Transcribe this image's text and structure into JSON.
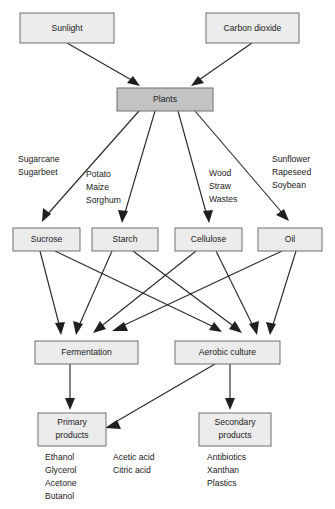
{
  "diagram": {
    "colors": {
      "box_light": "#ececec",
      "box_dark": "#c3c3c3",
      "box_border": "#6e6e6e",
      "edge": "#2b2b2b",
      "text": "#1a1a1a",
      "background": "#ffffff"
    },
    "nodes": {
      "sunlight": "Sunlight",
      "carbon_dioxide": "Carbon dioxide",
      "plants": "Plants",
      "sucrose": "Sucrose",
      "starch": "Starch",
      "cellulose": "Cellulose",
      "oil": "Oil",
      "fermentation": "Fermentation",
      "aerobic_culture": "Aerobic culture",
      "primary_products_line1": "Primary",
      "primary_products_line2": "products",
      "secondary_products_line1": "Secondary",
      "secondary_products_line2": "products"
    },
    "edge_labels": {
      "sucrose_sources": [
        "Sugarcane",
        "Sugarbeet"
      ],
      "starch_sources": [
        "Potato",
        "Maize",
        "Sorghum"
      ],
      "cellulose_sources": [
        "Wood",
        "Straw",
        "Wastes"
      ],
      "oil_sources": [
        "Sunflower",
        "Rapeseed",
        "Soybean"
      ]
    },
    "product_lists": {
      "primary_left": [
        "Ethanol",
        "Glycerol",
        "Acetone",
        "Butanol"
      ],
      "primary_right": [
        "Acetic acid",
        "Citric acid"
      ],
      "secondary": [
        "Antibiotics",
        "Xanthan",
        "Plastics"
      ]
    }
  }
}
